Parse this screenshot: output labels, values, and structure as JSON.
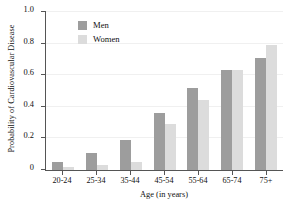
{
  "chart_data": {
    "type": "bar",
    "title": "",
    "xlabel": "Age (in years)",
    "ylabel": "Probability of Cardiovascular Disease",
    "categories": [
      "20-24",
      "25-34",
      "35-44",
      "45-54",
      "55-64",
      "65-74",
      "75+"
    ],
    "series": [
      {
        "name": "Men",
        "color": "#9d9d9d",
        "values": [
          0.05,
          0.11,
          0.19,
          0.36,
          0.52,
          0.63,
          0.71
        ]
      },
      {
        "name": "Women",
        "color": "#dcdcdc",
        "values": [
          0.02,
          0.03,
          0.05,
          0.29,
          0.44,
          0.63,
          0.79
        ]
      }
    ],
    "ylim": [
      0,
      1.0
    ],
    "ytick_labels": [
      "0",
      "0.2",
      "0.4",
      "0.6",
      "0.8",
      "1.0"
    ],
    "ytick_values": [
      0,
      0.2,
      0.4,
      0.6,
      0.8,
      1.0
    ],
    "grid": true,
    "legend_position": "top-left-inside"
  }
}
